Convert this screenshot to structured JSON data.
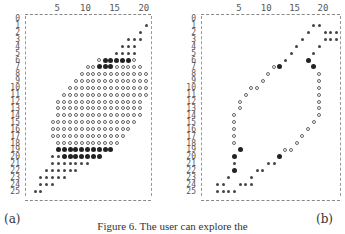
{
  "figure": {
    "caption": "Figure 6.  The user can explore the",
    "panel_labels": [
      "(a)",
      "(b)"
    ],
    "legend_symbols": {
      "o": "open-circle",
      "*": "small-asterisk",
      "#": "bold-bullet"
    },
    "axis": {
      "column_ticks": [
        {
          "label": "5",
          "col": 5
        },
        {
          "label": "10",
          "col": 10
        },
        {
          "label": "15",
          "col": 15
        },
        {
          "label": "20",
          "col": 20
        }
      ],
      "row_labels": [
        "0",
        "1",
        "2",
        "3",
        "4",
        "5",
        "6",
        "7",
        "8",
        "9",
        "10",
        "11",
        "12",
        "13",
        "14",
        "15",
        "16",
        "17",
        "18",
        "19",
        "20",
        "21",
        "22",
        "23",
        "24",
        "25"
      ]
    }
  },
  "panels": [
    {
      "id": "a",
      "label": "(a)",
      "rows": [
        [],
        [
          [
            20,
            "*"
          ]
        ],
        [
          [
            19,
            "*"
          ]
        ],
        [
          [
            17,
            "*"
          ],
          [
            18,
            "*"
          ],
          [
            19,
            "*"
          ]
        ],
        [
          [
            16,
            "*"
          ],
          [
            17,
            "*"
          ],
          [
            18,
            "*"
          ]
        ],
        [
          [
            15,
            "*"
          ],
          [
            16,
            "*"
          ],
          [
            17,
            "*"
          ],
          [
            18,
            "*"
          ]
        ],
        [
          [
            12,
            "o"
          ],
          [
            13,
            "#"
          ],
          [
            14,
            "#"
          ],
          [
            15,
            "#"
          ],
          [
            16,
            "#"
          ],
          [
            17,
            "#"
          ],
          [
            18,
            "o"
          ]
        ],
        [
          [
            10,
            "o"
          ],
          [
            11,
            "o"
          ],
          [
            12,
            "#"
          ],
          [
            13,
            "#"
          ],
          [
            14,
            "#"
          ],
          [
            15,
            "o"
          ],
          [
            16,
            "o"
          ],
          [
            17,
            "o"
          ],
          [
            18,
            "o"
          ],
          [
            19,
            "o"
          ]
        ],
        [
          [
            9,
            "o"
          ],
          [
            10,
            "o"
          ],
          [
            11,
            "o"
          ],
          [
            12,
            "o"
          ],
          [
            13,
            "o"
          ],
          [
            14,
            "o"
          ],
          [
            15,
            "o"
          ],
          [
            16,
            "o"
          ],
          [
            17,
            "o"
          ],
          [
            18,
            "o"
          ],
          [
            19,
            "o"
          ],
          [
            20,
            "o"
          ]
        ],
        [
          [
            8,
            "o"
          ],
          [
            9,
            "o"
          ],
          [
            10,
            "o"
          ],
          [
            11,
            "o"
          ],
          [
            12,
            "o"
          ],
          [
            13,
            "o"
          ],
          [
            14,
            "o"
          ],
          [
            15,
            "o"
          ],
          [
            16,
            "o"
          ],
          [
            17,
            "o"
          ],
          [
            18,
            "o"
          ],
          [
            19,
            "o"
          ],
          [
            20,
            "o"
          ]
        ],
        [
          [
            7,
            "o"
          ],
          [
            8,
            "o"
          ],
          [
            9,
            "o"
          ],
          [
            10,
            "o"
          ],
          [
            11,
            "o"
          ],
          [
            12,
            "o"
          ],
          [
            13,
            "o"
          ],
          [
            14,
            "o"
          ],
          [
            15,
            "o"
          ],
          [
            16,
            "o"
          ],
          [
            17,
            "o"
          ],
          [
            18,
            "o"
          ],
          [
            19,
            "o"
          ],
          [
            20,
            "o"
          ]
        ],
        [
          [
            6,
            "o"
          ],
          [
            7,
            "o"
          ],
          [
            8,
            "o"
          ],
          [
            9,
            "o"
          ],
          [
            10,
            "o"
          ],
          [
            11,
            "o"
          ],
          [
            12,
            "o"
          ],
          [
            13,
            "o"
          ],
          [
            14,
            "o"
          ],
          [
            15,
            "o"
          ],
          [
            16,
            "o"
          ],
          [
            17,
            "o"
          ],
          [
            18,
            "o"
          ],
          [
            19,
            "o"
          ],
          [
            20,
            "o"
          ]
        ],
        [
          [
            5,
            "o"
          ],
          [
            6,
            "o"
          ],
          [
            7,
            "o"
          ],
          [
            8,
            "o"
          ],
          [
            9,
            "o"
          ],
          [
            10,
            "o"
          ],
          [
            11,
            "o"
          ],
          [
            12,
            "o"
          ],
          [
            13,
            "o"
          ],
          [
            14,
            "o"
          ],
          [
            15,
            "o"
          ],
          [
            16,
            "o"
          ],
          [
            17,
            "o"
          ],
          [
            18,
            "o"
          ],
          [
            19,
            "o"
          ]
        ],
        [
          [
            5,
            "o"
          ],
          [
            6,
            "o"
          ],
          [
            7,
            "o"
          ],
          [
            8,
            "o"
          ],
          [
            9,
            "o"
          ],
          [
            10,
            "o"
          ],
          [
            11,
            "o"
          ],
          [
            12,
            "o"
          ],
          [
            13,
            "o"
          ],
          [
            14,
            "o"
          ],
          [
            15,
            "o"
          ],
          [
            16,
            "o"
          ],
          [
            17,
            "o"
          ],
          [
            18,
            "o"
          ],
          [
            19,
            "o"
          ]
        ],
        [
          [
            5,
            "o"
          ],
          [
            6,
            "o"
          ],
          [
            7,
            "o"
          ],
          [
            8,
            "o"
          ],
          [
            9,
            "o"
          ],
          [
            10,
            "o"
          ],
          [
            11,
            "o"
          ],
          [
            12,
            "o"
          ],
          [
            13,
            "o"
          ],
          [
            14,
            "o"
          ],
          [
            15,
            "o"
          ],
          [
            16,
            "o"
          ],
          [
            17,
            "o"
          ],
          [
            18,
            "o"
          ],
          [
            19,
            "o"
          ]
        ],
        [
          [
            4,
            "o"
          ],
          [
            5,
            "o"
          ],
          [
            6,
            "o"
          ],
          [
            7,
            "o"
          ],
          [
            8,
            "o"
          ],
          [
            9,
            "o"
          ],
          [
            10,
            "o"
          ],
          [
            11,
            "o"
          ],
          [
            12,
            "o"
          ],
          [
            13,
            "o"
          ],
          [
            14,
            "o"
          ],
          [
            15,
            "o"
          ],
          [
            16,
            "o"
          ],
          [
            17,
            "o"
          ],
          [
            18,
            "o"
          ]
        ],
        [
          [
            4,
            "o"
          ],
          [
            5,
            "o"
          ],
          [
            6,
            "o"
          ],
          [
            7,
            "o"
          ],
          [
            8,
            "o"
          ],
          [
            9,
            "o"
          ],
          [
            10,
            "o"
          ],
          [
            11,
            "o"
          ],
          [
            12,
            "o"
          ],
          [
            13,
            "o"
          ],
          [
            14,
            "o"
          ],
          [
            15,
            "o"
          ],
          [
            16,
            "o"
          ],
          [
            17,
            "o"
          ]
        ],
        [
          [
            4,
            "o"
          ],
          [
            5,
            "o"
          ],
          [
            6,
            "o"
          ],
          [
            7,
            "o"
          ],
          [
            8,
            "o"
          ],
          [
            9,
            "o"
          ],
          [
            10,
            "o"
          ],
          [
            11,
            "o"
          ],
          [
            12,
            "o"
          ],
          [
            13,
            "o"
          ],
          [
            14,
            "o"
          ],
          [
            15,
            "o"
          ],
          [
            16,
            "o"
          ]
        ],
        [
          [
            5,
            "o"
          ],
          [
            6,
            "o"
          ],
          [
            7,
            "o"
          ],
          [
            8,
            "o"
          ],
          [
            9,
            "o"
          ],
          [
            10,
            "o"
          ],
          [
            11,
            "o"
          ],
          [
            12,
            "o"
          ],
          [
            13,
            "o"
          ],
          [
            14,
            "o"
          ],
          [
            15,
            "o"
          ]
        ],
        [
          [
            5,
            "#"
          ],
          [
            6,
            "#"
          ],
          [
            7,
            "#"
          ],
          [
            8,
            "#"
          ],
          [
            9,
            "#"
          ],
          [
            10,
            "#"
          ],
          [
            11,
            "#"
          ],
          [
            12,
            "#"
          ],
          [
            13,
            "#"
          ],
          [
            14,
            "#"
          ]
        ],
        [
          [
            4,
            "*"
          ],
          [
            5,
            "*"
          ],
          [
            6,
            "#"
          ],
          [
            7,
            "#"
          ],
          [
            8,
            "#"
          ],
          [
            9,
            "#"
          ],
          [
            10,
            "#"
          ],
          [
            11,
            "#"
          ],
          [
            12,
            "#"
          ]
        ],
        [
          [
            4,
            "*"
          ],
          [
            5,
            "*"
          ],
          [
            6,
            "*"
          ],
          [
            7,
            "*"
          ],
          [
            8,
            "*"
          ],
          [
            9,
            "*"
          ],
          [
            10,
            "*"
          ]
        ],
        [
          [
            3,
            "*"
          ],
          [
            4,
            "*"
          ],
          [
            5,
            "*"
          ],
          [
            6,
            "*"
          ],
          [
            7,
            "*"
          ],
          [
            8,
            "*"
          ]
        ],
        [
          [
            2,
            "*"
          ],
          [
            3,
            "*"
          ],
          [
            4,
            "*"
          ],
          [
            5,
            "*"
          ],
          [
            6,
            "*"
          ]
        ],
        [
          [
            2,
            "*"
          ],
          [
            3,
            "*"
          ],
          [
            4,
            "*"
          ]
        ],
        [
          [
            1,
            "*"
          ],
          [
            2,
            "*"
          ]
        ]
      ]
    },
    {
      "id": "b",
      "label": "(b)",
      "rows": [
        [],
        [
          [
            18,
            "*"
          ],
          [
            19,
            "*"
          ]
        ],
        [
          [
            17,
            "*"
          ],
          [
            20,
            "*"
          ],
          [
            21,
            "*"
          ],
          [
            22,
            "*"
          ]
        ],
        [
          [
            16,
            "*"
          ],
          [
            20,
            "*"
          ],
          [
            21,
            "*"
          ],
          [
            22,
            "*"
          ]
        ],
        [
          [
            15,
            "*"
          ],
          [
            19,
            "*"
          ]
        ],
        [
          [
            14,
            "*"
          ],
          [
            18,
            "*"
          ]
        ],
        [
          [
            13,
            "*"
          ],
          [
            17,
            "#"
          ]
        ],
        [
          [
            11,
            "o"
          ],
          [
            12,
            "#"
          ],
          [
            18,
            "#"
          ]
        ],
        [
          [
            10,
            "o"
          ],
          [
            19,
            "o"
          ]
        ],
        [
          [
            9,
            "o"
          ],
          [
            19,
            "o"
          ]
        ],
        [
          [
            7,
            "o"
          ],
          [
            8,
            "o"
          ],
          [
            19,
            "o"
          ]
        ],
        [
          [
            6,
            "o"
          ],
          [
            19,
            "o"
          ]
        ],
        [
          [
            5,
            "o"
          ],
          [
            19,
            "o"
          ]
        ],
        [
          [
            5,
            "o"
          ],
          [
            19,
            "o"
          ]
        ],
        [
          [
            4,
            "o"
          ],
          [
            19,
            "o"
          ]
        ],
        [
          [
            4,
            "o"
          ],
          [
            18,
            "o"
          ]
        ],
        [
          [
            4,
            "o"
          ],
          [
            17,
            "o"
          ]
        ],
        [
          [
            4,
            "o"
          ],
          [
            16,
            "o"
          ]
        ],
        [
          [
            4,
            "o"
          ],
          [
            15,
            "o"
          ]
        ],
        [
          [
            5,
            "#"
          ],
          [
            13,
            "o"
          ],
          [
            14,
            "o"
          ]
        ],
        [
          [
            4,
            "#"
          ],
          [
            12,
            "#"
          ]
        ],
        [
          [
            4,
            "*"
          ],
          [
            10,
            "*"
          ],
          [
            11,
            "*"
          ]
        ],
        [
          [
            4,
            "#"
          ],
          [
            8,
            "*"
          ],
          [
            9,
            "*"
          ]
        ],
        [
          [
            3,
            "*"
          ],
          [
            7,
            "*"
          ]
        ],
        [
          [
            1,
            "*"
          ],
          [
            2,
            "*"
          ],
          [
            5,
            "*"
          ],
          [
            6,
            "*"
          ],
          [
            7,
            "*"
          ]
        ],
        [
          [
            1,
            "*"
          ],
          [
            2,
            "*"
          ],
          [
            3,
            "*"
          ],
          [
            4,
            "*"
          ]
        ]
      ]
    }
  ]
}
